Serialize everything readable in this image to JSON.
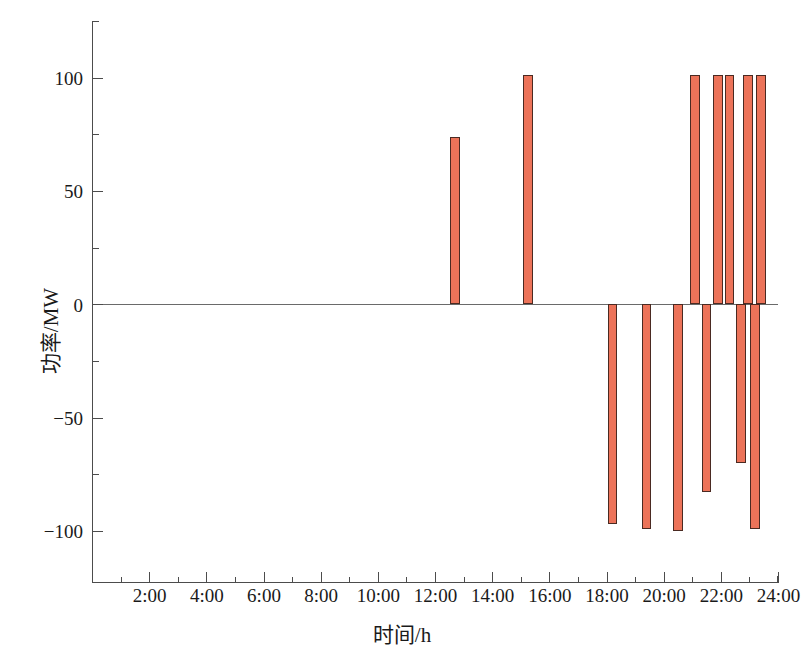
{
  "chart_data": {
    "type": "bar",
    "title": "",
    "xlabel": "时间/h",
    "ylabel": "功率/MW",
    "xlim": [
      0,
      24
    ],
    "ylim": [
      -123,
      125
    ],
    "grid": false,
    "legend": null,
    "bar_color": "#ec7359",
    "bar_edge_color": "#4a2a22",
    "axis_color": "#4c4c4c",
    "x_unit": "hour",
    "y_unit": "MW",
    "xticks": [
      2,
      4,
      6,
      8,
      10,
      12,
      14,
      16,
      18,
      20,
      22,
      24
    ],
    "xtick_labels": [
      "2:00",
      "4:00",
      "6:00",
      "8:00",
      "10:00",
      "12:00",
      "14:00",
      "16:00",
      "18:00",
      "20:00",
      "22:00",
      "24:00"
    ],
    "x_minor_ticks": [
      1,
      3,
      5,
      7,
      9,
      11,
      13,
      15,
      17,
      19,
      21,
      23
    ],
    "yticks": [
      -100,
      -50,
      0,
      50,
      100
    ],
    "ytick_labels": [
      "−100",
      "−50",
      "0",
      "50",
      "100"
    ],
    "y_minor_ticks": [
      -75,
      -25,
      25,
      75
    ],
    "bar_width_hours": 0.33,
    "x": [
      12.7,
      15.25,
      18.2,
      19.4,
      20.5,
      21.1,
      21.5,
      21.9,
      22.3,
      22.7,
      23.4
    ],
    "values": [
      74,
      101,
      -97,
      -99,
      -100,
      101,
      -83,
      101,
      101,
      -70,
      101
    ],
    "bars": [
      {
        "time": "12:42",
        "x": 12.7,
        "value": 74
      },
      {
        "time": "15:15",
        "x": 15.25,
        "value": 101
      },
      {
        "time": "18:12",
        "x": 18.2,
        "value": -97
      },
      {
        "time": "19:24",
        "x": 19.4,
        "value": -99
      },
      {
        "time": "20:30",
        "x": 20.5,
        "value": -100
      },
      {
        "time": "21:06",
        "x": 21.1,
        "value": 101
      },
      {
        "time": "21:30",
        "x": 21.5,
        "value": -83
      },
      {
        "time": "21:54",
        "x": 21.9,
        "value": 101
      },
      {
        "time": "22:18",
        "x": 22.3,
        "value": 101
      },
      {
        "time": "22:42",
        "x": 22.7,
        "value": -70
      },
      {
        "time": "22:54",
        "x": 22.95,
        "value": 101
      },
      {
        "time": "23:12",
        "x": 23.2,
        "value": -99
      },
      {
        "time": "23:24",
        "x": 23.4,
        "value": 101
      }
    ]
  }
}
